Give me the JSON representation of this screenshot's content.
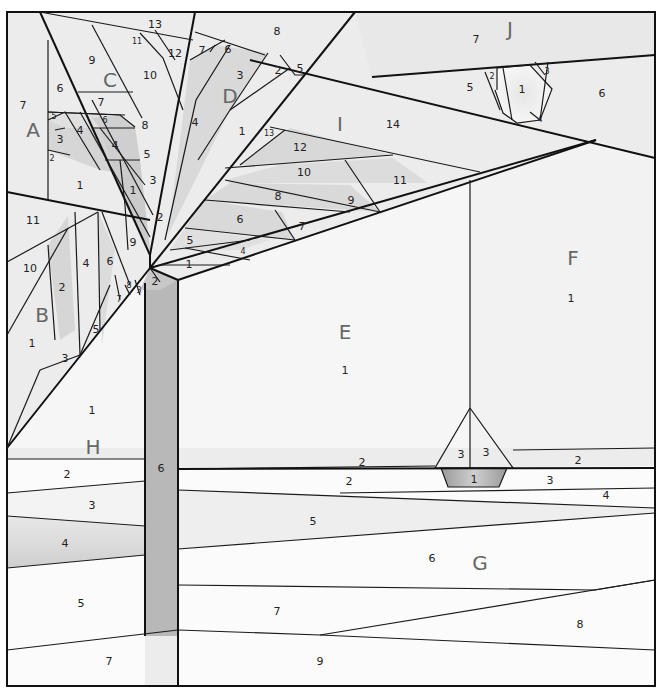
{
  "diagram": {
    "colors": {
      "background": "#ececec",
      "light": "#f6f6f6",
      "mid": "#d9d9d9",
      "dark": "#bdbdbd",
      "trunk": "#b8b8b8",
      "line": "#1a1a1a",
      "section_label": "#666666"
    },
    "sections": [
      {
        "id": "A",
        "label": "A",
        "pieces": [
          "1",
          "2",
          "3",
          "4",
          "5",
          "6",
          "7"
        ]
      },
      {
        "id": "B",
        "label": "B",
        "pieces": [
          "1",
          "2",
          "3",
          "4",
          "5",
          "6",
          "7",
          "8",
          "9",
          "10",
          "11"
        ]
      },
      {
        "id": "C",
        "label": "C",
        "pieces": [
          "1",
          "2",
          "3",
          "4",
          "5",
          "6",
          "7",
          "8",
          "9",
          "10",
          "11",
          "12",
          "13"
        ]
      },
      {
        "id": "D",
        "label": "D",
        "pieces": [
          "1",
          "2",
          "3",
          "4",
          "5",
          "6",
          "7",
          "8"
        ]
      },
      {
        "id": "E",
        "label": "E",
        "pieces": [
          "1"
        ]
      },
      {
        "id": "F",
        "label": "F",
        "pieces": [
          "1"
        ]
      },
      {
        "id": "G",
        "label": "G",
        "pieces": [
          "1",
          "2",
          "3",
          "4",
          "5",
          "6",
          "7",
          "8",
          "9"
        ]
      },
      {
        "id": "H",
        "label": "H",
        "pieces": [
          "1",
          "2",
          "3",
          "4",
          "5",
          "6",
          "7"
        ]
      },
      {
        "id": "I",
        "label": "I",
        "pieces": [
          "1",
          "2",
          "3",
          "4",
          "5",
          "6",
          "7",
          "8",
          "9",
          "10",
          "11",
          "12",
          "13",
          "14"
        ]
      },
      {
        "id": "J",
        "label": "J",
        "pieces": [
          "1",
          "2",
          "3",
          "4",
          "5",
          "6",
          "7"
        ]
      }
    ],
    "labels": {
      "A": {
        "sec": "A",
        "n1": "1",
        "n2": "2",
        "n3": "3",
        "n4": "4",
        "n5": "5",
        "n6": "6",
        "n7": "7"
      },
      "B": {
        "sec": "B",
        "n1": "1",
        "n2": "2",
        "n3": "3",
        "n4": "4",
        "n5": "5",
        "n6": "6",
        "n7": "7",
        "n8": "8",
        "n9": "9",
        "n10": "10",
        "n11": "11"
      },
      "C": {
        "sec": "C",
        "n1": "1",
        "n2": "2",
        "n3": "3",
        "n4": "4",
        "n5": "5",
        "n6": "6",
        "n7": "7",
        "n8": "8",
        "n9": "9",
        "n10": "10",
        "n11": "11",
        "n12": "12",
        "n13": "13"
      },
      "D": {
        "sec": "D",
        "n1": "1",
        "n2": "2",
        "n3": "3",
        "n4": "4",
        "n5": "5",
        "n6": "6",
        "n7": "7",
        "n8": "8"
      },
      "E": {
        "sec": "E",
        "n1": "1"
      },
      "F": {
        "sec": "F",
        "n1": "1"
      },
      "G": {
        "sec": "G",
        "n1": "1",
        "n2": "2",
        "n3": "3",
        "n4": "4",
        "n5": "5",
        "n6": "6",
        "n7": "7",
        "n8": "8",
        "n9": "9"
      },
      "H": {
        "sec": "H",
        "n1": "1",
        "n2": "2",
        "n3": "3",
        "n4": "4",
        "n5": "5",
        "n6": "6",
        "n7": "7"
      },
      "I": {
        "sec": "I",
        "n1": "1",
        "n2": "2",
        "n4": "4",
        "n5": "5",
        "n6": "6",
        "n7": "7",
        "n8": "8",
        "n9": "9",
        "n10": "10",
        "n11": "11",
        "n12": "12",
        "n13": "13",
        "n14": "14"
      },
      "J": {
        "sec": "J",
        "n1": "1",
        "n2": "2",
        "n3": "3",
        "n4": "4",
        "n5": "5",
        "n6": "6",
        "n7": "7"
      },
      "boat": {
        "hull": "1",
        "sail_left": "3",
        "sail_right": "3",
        "water_left": "2",
        "water_right": "2",
        "g3": "3",
        "g4": "4"
      }
    }
  }
}
